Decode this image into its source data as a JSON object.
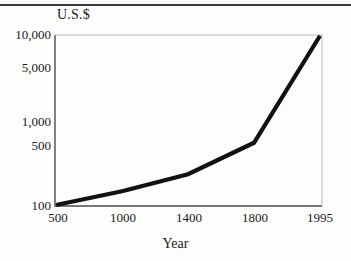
{
  "figure": {
    "background_color": "#fdfdfc",
    "line_color": "#111111",
    "frame_color": "#4a4a4a",
    "top_rule": "horizontal-rule"
  },
  "chart_data": {
    "type": "line",
    "title": "",
    "xlabel": "Year",
    "ylabel": "U.S.$",
    "yscale": "log",
    "grid": false,
    "legend": "none",
    "categories": [
      "500",
      "1000",
      "1400",
      "1800",
      "1995"
    ],
    "x_tick_labels": [
      "500",
      "1000",
      "1400",
      "1800",
      "1995"
    ],
    "y_tick_labels": [
      "10,000",
      "5,000",
      "1,000",
      "500",
      "100"
    ],
    "y_tick_values": [
      10000,
      5000,
      1000,
      500,
      100
    ],
    "ylim": [
      100,
      10000
    ],
    "series": [
      {
        "name": "GDP per capita",
        "x": [
          "500",
          "1000",
          "1400",
          "1800",
          "1995"
        ],
        "values": [
          100,
          145,
          230,
          540,
          9800
        ]
      }
    ],
    "annotations": []
  },
  "axes": {
    "y_title": "U.S.$",
    "x_title": "Year"
  }
}
